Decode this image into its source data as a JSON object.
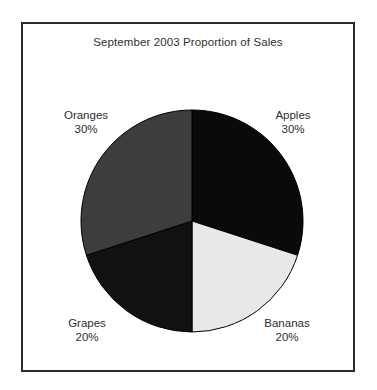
{
  "chart_data": {
    "type": "pie",
    "title": "September 2003 Proportion of Sales",
    "xlabel": "",
    "ylabel": "",
    "legend_position": "none",
    "grid": false,
    "start_angle_deg": 0,
    "direction": "clockwise",
    "categories": [
      "Apples",
      "Bananas",
      "Grapes",
      "Oranges"
    ],
    "values": [
      30,
      20,
      20,
      30
    ],
    "unit": "%",
    "slices": [
      {
        "name": "apples",
        "label": "Apples",
        "percent_text": "30%",
        "value": 30,
        "color": "#0a0a0a",
        "start_deg": 0,
        "end_deg": 108,
        "label_position": "top-right"
      },
      {
        "name": "bananas",
        "label": "Bananas",
        "percent_text": "20%",
        "value": 20,
        "color": "#e8e8e8",
        "start_deg": 108,
        "end_deg": 180,
        "label_position": "bottom-right"
      },
      {
        "name": "grapes",
        "label": "Grapes",
        "percent_text": "20%",
        "value": 20,
        "color": "#111111",
        "start_deg": 180,
        "end_deg": 252,
        "label_position": "bottom-left"
      },
      {
        "name": "oranges",
        "label": "Oranges",
        "percent_text": "30%",
        "value": 30,
        "color": "#3d3d3d",
        "start_deg": 252,
        "end_deg": 360,
        "label_position": "top-left"
      }
    ],
    "colors": {
      "apples": "#0a0a0a",
      "bananas": "#e8e8e8",
      "grapes": "#111111",
      "oranges": "#3d3d3d",
      "slice_outline": "#000000",
      "frame_border": "#2b2b2b",
      "background": "#ffffff",
      "text": "#2e2e2e"
    }
  }
}
